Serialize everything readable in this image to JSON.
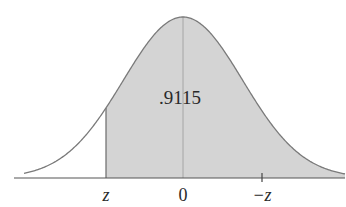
{
  "diagram": {
    "type": "normal-distribution",
    "area_label": ".9115",
    "axis_labels": {
      "left": "z",
      "center": "0",
      "right": "−z"
    },
    "colors": {
      "shade": "#d4d4d4",
      "curve": "#7a7a7a",
      "axis": "#555555",
      "text": "#2a2a2a"
    }
  },
  "chart_data": {
    "type": "area",
    "title": "",
    "shaded_region": {
      "from": "z",
      "to": "+infinity"
    },
    "shaded_area_value": 0.9115,
    "x_ticks": [
      "z",
      "0",
      "−z"
    ],
    "xlabel": "",
    "ylabel": ""
  }
}
